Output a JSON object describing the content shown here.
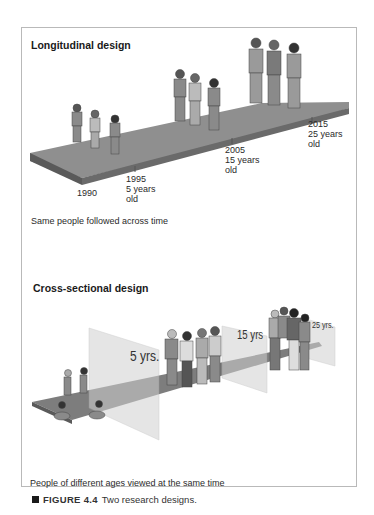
{
  "longitudinal": {
    "title": "Longitudinal design",
    "labels": [
      {
        "year": "1990",
        "age": "",
        "suffix": ""
      },
      {
        "year": "1995",
        "age": "5 years",
        "suffix": "old"
      },
      {
        "year": "2005",
        "age": "15 years",
        "suffix": "old"
      },
      {
        "year": "2015",
        "age": "25 years",
        "suffix": "old"
      }
    ],
    "caption": "Same people followed across time"
  },
  "cross_sectional": {
    "title": "Cross-sectional design",
    "panels": [
      "5 yrs.",
      "15 yrs",
      "25 yrs."
    ],
    "caption": "People of different ages viewed at the same time"
  },
  "figure": {
    "number": "FIGURE 4.4",
    "caption": "Two research designs."
  },
  "colors": {
    "walkway_top": "#8f8f8f",
    "walkway_side": "#5e5e5e",
    "panel_glass": "#d9d9d9",
    "frame_border": "#b9b9b9"
  }
}
